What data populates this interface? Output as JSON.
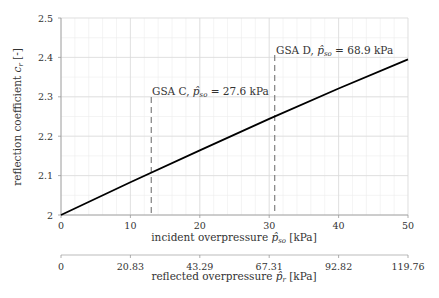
{
  "chart_data": {
    "type": "line",
    "title": "",
    "xlabel": "incident overpressure p̂_so [kPa]",
    "ylabel": "reflection coefficient c_r [-]",
    "secondary_xlabel": "reflected overpressure p̂_r [kPa]",
    "xlim": [
      0,
      50
    ],
    "ylim": [
      2.0,
      2.5
    ],
    "x_ticks": [
      "0",
      "10",
      "20",
      "30",
      "40",
      "50"
    ],
    "y_ticks": [
      "2",
      "2.1",
      "2.2",
      "2.3",
      "2.4",
      "2.5"
    ],
    "secondary_x_ticks": [
      "0",
      "20.83",
      "43.29",
      "67.31",
      "92.82",
      "119.76"
    ],
    "grid": true,
    "minor_grid": true,
    "series": [
      {
        "name": "reflection coefficient",
        "x": [
          0,
          10,
          20,
          30,
          40,
          50
        ],
        "y": [
          2.0,
          2.083,
          2.164,
          2.244,
          2.321,
          2.395
        ],
        "style": "solid",
        "color": "#000000"
      }
    ],
    "annotations": [
      {
        "label": "GSA C, p̂_so = 27.6 kPa",
        "x": 13.0,
        "style": "dashed",
        "color": "#666666"
      },
      {
        "label": "GSA D, p̂_so = 68.9 kPa",
        "x": 30.8,
        "style": "dashed",
        "color": "#666666"
      }
    ]
  },
  "labels": {
    "xlabel_text": "incident overpressure ",
    "xlabel_unit": " [kPa]",
    "ylabel_text": "reflection coefficient ",
    "ylabel_unit": " [-]",
    "x2label_text": "reflected overpressure ",
    "x2label_unit": " [kPa]",
    "ann_c_prefix": "GSA C, ",
    "ann_c_value": " = 27.6 kPa",
    "ann_d_prefix": "GSA D, ",
    "ann_d_value": " = 68.9 kPa"
  }
}
